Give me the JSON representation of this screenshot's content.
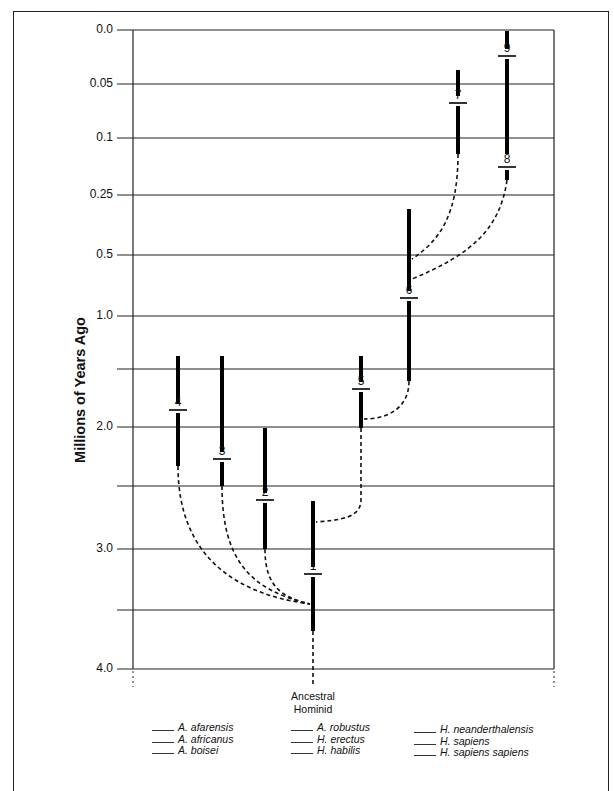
{
  "chart_data": {
    "type": "phylogenetic-tree",
    "ylabel": "Millions of Years Ago",
    "y_ticks": [
      {
        "label": "0.0",
        "y": 30
      },
      {
        "label": "0.05",
        "y": 84
      },
      {
        "label": "0.1",
        "y": 138
      },
      {
        "label": "0.25",
        "y": 195
      },
      {
        "label": "0.5",
        "y": 255
      },
      {
        "label": "1.0",
        "y": 316
      },
      {
        "label": "",
        "y": 369
      },
      {
        "label": "2.0",
        "y": 427
      },
      {
        "label": "",
        "y": 486
      },
      {
        "label": "3.0",
        "y": 549
      },
      {
        "label": "",
        "y": 610
      },
      {
        "label": "4.0",
        "y": 669
      }
    ],
    "bars": [
      {
        "id": "1",
        "x": 313,
        "top": 501,
        "bottom": 631,
        "label_y": 574
      },
      {
        "id": "2",
        "x": 265,
        "top": 428,
        "bottom": 549,
        "label_y": 500
      },
      {
        "id": "3",
        "x": 222,
        "top": 356,
        "bottom": 486,
        "label_y": 459
      },
      {
        "id": "4",
        "x": 178,
        "top": 356,
        "bottom": 466,
        "label_y": 410
      },
      {
        "id": "5",
        "x": 361,
        "top": 356,
        "bottom": 428,
        "label_y": 389
      },
      {
        "id": "6",
        "x": 409,
        "top": 209,
        "bottom": 381,
        "label_y": 298
      },
      {
        "id": "7",
        "x": 458,
        "top": 70,
        "bottom": 154,
        "label_y": 103
      },
      {
        "id": "8",
        "x": 507,
        "top": 160,
        "bottom": 180,
        "label_y": 167
      },
      {
        "id": "9",
        "x": 507,
        "top": 31,
        "bottom": 154,
        "label_y": 56
      }
    ],
    "root_label": [
      "Ancestral",
      "Hominid"
    ],
    "legend": [
      [
        "A. afarensis",
        "A. africanus",
        "A. boisei"
      ],
      [
        "A. robustus",
        "H. erectus",
        "H. habilis"
      ],
      [
        "H. neanderthalensis",
        "H. sapiens",
        "H. sapiens sapiens"
      ]
    ]
  }
}
